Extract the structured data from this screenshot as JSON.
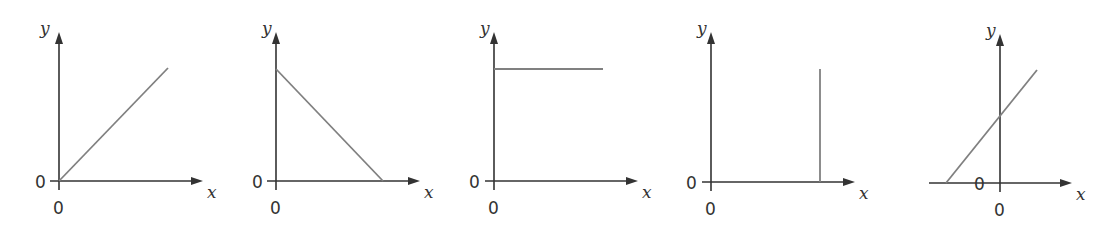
{
  "chart_data": [
    {
      "type": "line",
      "title": "",
      "xlabel": "x",
      "ylabel": "y",
      "origin_labels": [
        "0",
        "0"
      ],
      "description": "Straight line through origin with positive slope",
      "frame": {
        "ox": 59,
        "oy": 181,
        "x_end": 203,
        "y_end": 32,
        "x_start": 50
      },
      "series": [
        {
          "name": "graph-1",
          "points": [
            [
              59,
              181
            ],
            [
              168,
              68
            ]
          ]
        }
      ],
      "labels": {
        "y": {
          "x": 40,
          "y": 34
        },
        "x": {
          "x": 207,
          "y": 198
        },
        "zero_left": {
          "x": 35,
          "y": 188
        },
        "zero_below": {
          "x": 53,
          "y": 214
        }
      }
    },
    {
      "type": "line",
      "title": "",
      "xlabel": "x",
      "ylabel": "y",
      "origin_labels": [
        "0",
        "0"
      ],
      "description": "Straight line with negative slope from y-intercept to x-intercept",
      "frame": {
        "ox": 276,
        "oy": 181,
        "x_end": 420,
        "y_end": 32,
        "x_start": 267
      },
      "series": [
        {
          "name": "graph-2",
          "points": [
            [
              276,
              69
            ],
            [
              383,
              181
            ]
          ]
        }
      ],
      "labels": {
        "y": {
          "x": 262,
          "y": 34
        },
        "x": {
          "x": 424,
          "y": 198
        },
        "zero_left": {
          "x": 252,
          "y": 188
        },
        "zero_below": {
          "x": 270,
          "y": 214
        }
      }
    },
    {
      "type": "line",
      "title": "",
      "xlabel": "x",
      "ylabel": "y",
      "origin_labels": [
        "0",
        "0"
      ],
      "description": "Horizontal line (constant y)",
      "frame": {
        "ox": 494,
        "oy": 181,
        "x_end": 638,
        "y_end": 32,
        "x_start": 485
      },
      "series": [
        {
          "name": "graph-3",
          "points": [
            [
              494,
              69
            ],
            [
              603,
              69
            ]
          ]
        }
      ],
      "labels": {
        "y": {
          "x": 480,
          "y": 34
        },
        "x": {
          "x": 642,
          "y": 198
        },
        "zero_left": {
          "x": 469,
          "y": 188
        },
        "zero_below": {
          "x": 488,
          "y": 214
        }
      }
    },
    {
      "type": "line",
      "title": "",
      "xlabel": "x",
      "ylabel": "y",
      "origin_labels": [
        "0",
        "0"
      ],
      "description": "Vertical line (constant x)",
      "frame": {
        "ox": 711,
        "oy": 182,
        "x_end": 855,
        "y_end": 32,
        "x_start": 702
      },
      "series": [
        {
          "name": "graph-4",
          "points": [
            [
              820,
              69
            ],
            [
              820,
              182
            ]
          ]
        }
      ],
      "labels": {
        "y": {
          "x": 697,
          "y": 34
        },
        "x": {
          "x": 859,
          "y": 199
        },
        "zero_left": {
          "x": 686,
          "y": 189
        },
        "zero_below": {
          "x": 705,
          "y": 215
        }
      }
    },
    {
      "type": "line",
      "title": "",
      "xlabel": "x",
      "ylabel": "y",
      "origin_labels": [
        "0",
        "0"
      ],
      "description": "Straight line with positive slope and positive y-intercept, x-intercept negative",
      "frame": {
        "ox": 1000,
        "oy": 183,
        "x_end": 1072,
        "y_end": 34,
        "x_start": 929
      },
      "series": [
        {
          "name": "graph-5",
          "points": [
            [
              946,
              183
            ],
            [
              1037,
              70
            ]
          ]
        }
      ],
      "labels": {
        "y": {
          "x": 986,
          "y": 36
        },
        "x": {
          "x": 1076,
          "y": 200
        },
        "zero_left": {
          "x": 974,
          "y": 190
        },
        "zero_below": {
          "x": 994,
          "y": 216
        }
      }
    }
  ]
}
